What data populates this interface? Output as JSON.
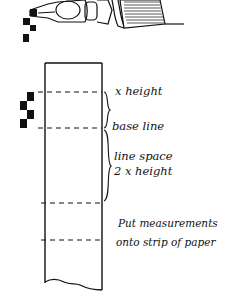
{
  "diagram": {
    "labels": {
      "x_height": "x height",
      "base_line": "base line",
      "line_space": "line space",
      "line_space_value": "2  x height",
      "instruction_line1": "Put measurements",
      "instruction_line2": "onto strip of paper"
    },
    "pen_nib": {
      "icon": "calligraphy-pen-nib-icon",
      "nib_width_marks": 3
    },
    "strip": {
      "dashed_lines": 4,
      "nib_marks_beside_strip": 4
    },
    "colors": {
      "ink": "#111111",
      "paper": "#ffffff"
    }
  }
}
